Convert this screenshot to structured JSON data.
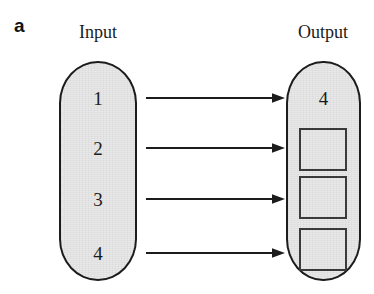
{
  "figure": {
    "panel_letter": "a",
    "width": 374,
    "height": 294
  },
  "colors": {
    "capsule_fill": "#e9e9e9",
    "stroke": "#1c1c1c",
    "box_stroke": "#3a3a3a",
    "text": "#1a1a1a",
    "background": "#ffffff"
  },
  "input": {
    "caption": "Input",
    "items": [
      {
        "label": "1"
      },
      {
        "label": "2"
      },
      {
        "label": "3"
      },
      {
        "label": "4"
      }
    ]
  },
  "output": {
    "caption": "Output",
    "items": [
      {
        "label": "4",
        "kind": "number"
      },
      {
        "label": "",
        "kind": "empty-box"
      },
      {
        "label": "",
        "kind": "empty-box"
      },
      {
        "label": "",
        "kind": "empty-box"
      }
    ]
  },
  "arrows": [
    {
      "name": "arrow-1",
      "from": "input-1",
      "to": "output-1"
    },
    {
      "name": "arrow-2",
      "from": "input-2",
      "to": "output-2"
    },
    {
      "name": "arrow-3",
      "from": "input-3",
      "to": "output-3"
    },
    {
      "name": "arrow-4",
      "from": "input-4",
      "to": "output-4"
    }
  ]
}
